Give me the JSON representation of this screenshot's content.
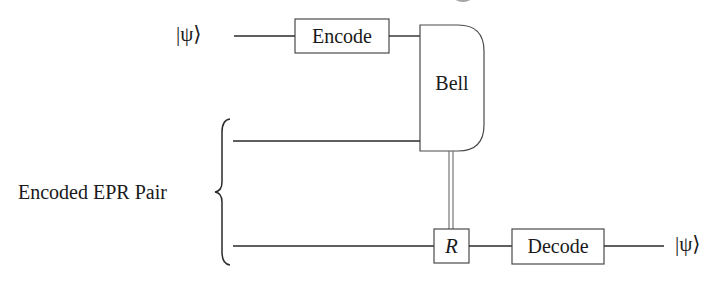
{
  "diagram": {
    "type": "quantum-circuit",
    "colors": {
      "line": "#2a2a2a",
      "gate_border": "#4a4a4a",
      "background": "#ffffff",
      "text": "#1a1a1a"
    },
    "inputs": {
      "top_state": "|ψ⟩"
    },
    "outputs": {
      "bottom_state": "|ψ⟩"
    },
    "gates": {
      "encode": "Encode",
      "bell": "Bell",
      "recovery": "R",
      "decode": "Decode"
    },
    "group_label": "Encoded EPR Pair",
    "wires": [
      {
        "id": "top",
        "description": "input qubit |ψ⟩ → Encode → Bell measurement"
      },
      {
        "id": "middle",
        "description": "first half of encoded EPR pair → Bell measurement"
      },
      {
        "id": "bottom",
        "description": "second half of encoded EPR pair → R → Decode → |ψ⟩"
      }
    ],
    "classical_link": {
      "from": "bell",
      "to": "recovery",
      "style": "double-line"
    }
  }
}
